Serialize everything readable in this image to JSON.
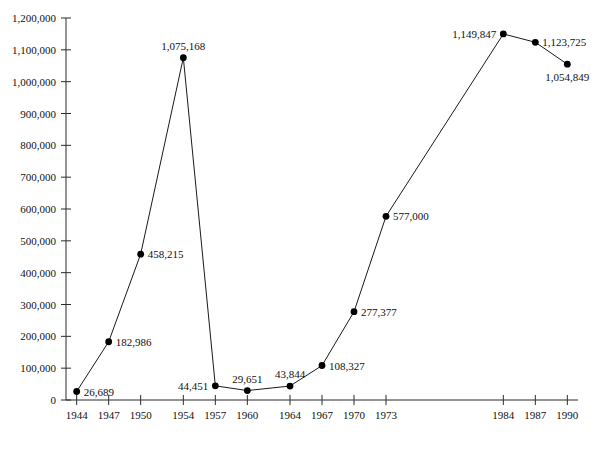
{
  "chart_data": {
    "type": "line",
    "title": "",
    "subtitle": "",
    "xlabel": "",
    "ylabel": "",
    "grid": false,
    "legend": "none",
    "categories": [
      "1944",
      "1947",
      "1950",
      "1954",
      "1957",
      "1960",
      "1964",
      "1967",
      "1970",
      "1973",
      "1984",
      "1987",
      "1990"
    ],
    "x": [
      1944,
      1947,
      1950,
      1954,
      1957,
      1960,
      1964,
      1967,
      1970,
      1973,
      1984,
      1987,
      1990
    ],
    "values": [
      26689,
      182986,
      458215,
      1075168,
      44451,
      29651,
      43844,
      108327,
      277377,
      577000,
      1149847,
      1123725,
      1054849
    ],
    "point_labels": [
      "26,689",
      "182,986",
      "458,215",
      "1,075,168",
      "44,451",
      "29,651",
      "43,844",
      "108,327",
      "277,377",
      "577,000",
      "1,149,847",
      "1,123,725",
      "1,054,849"
    ],
    "label_positions": [
      "right",
      "right",
      "right",
      "above",
      "left",
      "above",
      "above",
      "right",
      "right",
      "right",
      "left",
      "right",
      "below"
    ],
    "xlim": [
      1943,
      1991
    ],
    "ylim": [
      0,
      1200000
    ],
    "ytick_values": [
      0,
      100000,
      200000,
      300000,
      400000,
      500000,
      600000,
      700000,
      800000,
      900000,
      1000000,
      1100000,
      1200000
    ],
    "ytick_labels": [
      "0",
      "100,000",
      "200,000",
      "300,000",
      "400,000",
      "500,000",
      "600,000",
      "700,000",
      "800,000",
      "900,000",
      "1,000,000",
      "1,100,000",
      "1,200,000"
    ],
    "series": [
      {
        "name": "series-1",
        "color": "#1a1a1a",
        "values": [
          26689,
          182986,
          458215,
          1075168,
          44451,
          29651,
          43844,
          108327,
          277377,
          577000,
          1149847,
          1123725,
          1054849
        ]
      }
    ]
  },
  "colors": {
    "axis": "#2b2b2b",
    "line": "#1a1a1a",
    "marker": "#000000",
    "text": "#111111",
    "background": "#ffffff"
  }
}
